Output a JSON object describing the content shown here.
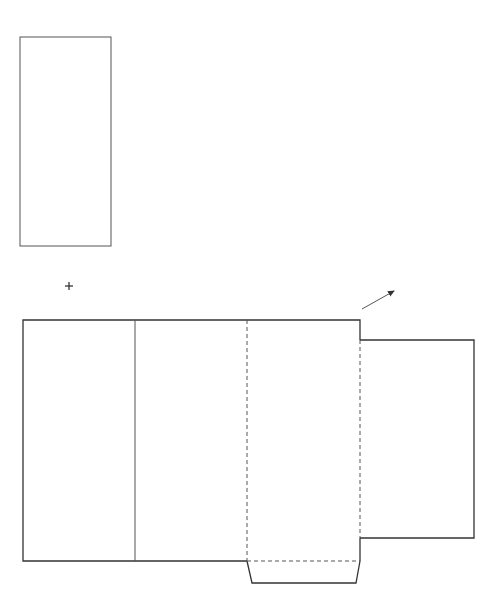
{
  "diagram": {
    "canvas": {
      "width": 496,
      "height": 601,
      "background": "#ffffff",
      "stroke": "#333333"
    },
    "symbols": {
      "plus": {
        "label": "+",
        "cx": 69,
        "cy": 286,
        "size": 8
      },
      "arrow": {
        "label": "fold direction arrow",
        "x1": 362,
        "y1": 309,
        "x2": 395,
        "y2": 290
      }
    },
    "insert_panel": {
      "label": "separate panel",
      "x": 20,
      "y": 37,
      "width": 91,
      "height": 209
    },
    "net": {
      "main_rect": {
        "x1": 23,
        "y1": 320,
        "x2": 360,
        "y2": 561
      },
      "fold_lines": [
        {
          "label": "fold line 1",
          "x": 135,
          "y1": 320,
          "y2": 561,
          "style": "solid"
        },
        {
          "label": "fold line 2",
          "x": 247,
          "y1": 320,
          "y2": 561,
          "style": "dashed"
        },
        {
          "label": "fold line 3",
          "x": 360,
          "y1": 340,
          "y2": 538,
          "style": "dashed"
        },
        {
          "label": "bottom flap fold",
          "x1": 247,
          "x2": 360,
          "y": 561,
          "style": "dashed"
        }
      ],
      "right_flap": {
        "x1": 360,
        "y1": 340,
        "x2": 474,
        "y2": 538
      },
      "bottom_flap": {
        "top_left": [
          247,
          561
        ],
        "top_right": [
          360,
          561
        ],
        "bottom_right": [
          356,
          583
        ],
        "bottom_left": [
          252,
          583
        ]
      }
    }
  }
}
